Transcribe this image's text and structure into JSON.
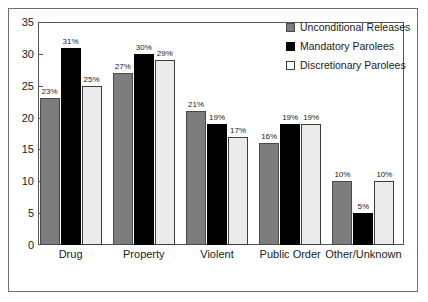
{
  "chart_data": {
    "type": "bar",
    "title": "",
    "xlabel": "",
    "ylabel": "",
    "ylim": [
      0,
      35
    ],
    "ytick_step": 5,
    "yticks": [
      0,
      5,
      10,
      15,
      20,
      25,
      30,
      35
    ],
    "grid": false,
    "legend_position": "top-right",
    "categories": [
      "Drug",
      "Property",
      "Violent",
      "Public Order",
      "Other/Unknown"
    ],
    "series": [
      {
        "name": "Unconditional Releases",
        "color": "#7d7d7d",
        "values": [
          23,
          27,
          21,
          16,
          10
        ],
        "labels": [
          "23%",
          "27%",
          "21%",
          "16%",
          "10%"
        ]
      },
      {
        "name": "Mandatory Parolees",
        "color": "#000000",
        "values": [
          31,
          30,
          19,
          19,
          5
        ],
        "labels": [
          "31%",
          "30%",
          "19%",
          "19%",
          "5%"
        ]
      },
      {
        "name": "Discretionary Parolees",
        "color": "#ebebeb",
        "values": [
          25,
          29,
          17,
          19,
          10
        ],
        "labels": [
          "25%",
          "29%",
          "17%",
          "19%",
          "10%"
        ]
      }
    ]
  }
}
